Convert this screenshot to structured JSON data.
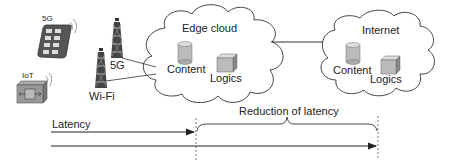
{
  "devices": {
    "phone": {
      "label": "5G",
      "icon": "smartphone-icon"
    },
    "iot": {
      "label": "IoT",
      "icon": "iot-device-icon"
    }
  },
  "towers": [
    {
      "label": "5G",
      "icon": "cell-tower-icon"
    },
    {
      "label": "Wi-Fi",
      "icon": "cell-tower-icon"
    }
  ],
  "clouds": {
    "edge": {
      "title": "Edge cloud",
      "content_label": "Content",
      "logic_label": "Logics"
    },
    "internet": {
      "title": "Internet",
      "content_label": "Content",
      "logic_label": "Logics"
    }
  },
  "latency": {
    "label": "Latency",
    "reduction_label": "Reduction of latency"
  },
  "colors": {
    "stroke": "#333333",
    "fill_gray": "#bdbdbd",
    "fill_dark": "#5a5a5a"
  }
}
